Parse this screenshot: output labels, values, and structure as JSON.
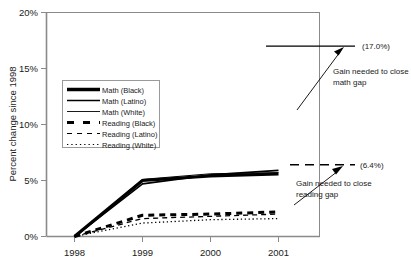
{
  "chart_data": {
    "type": "line",
    "title": "",
    "xlabel": "",
    "ylabel": "Percent change since 1998",
    "x": [
      "1998",
      "1999",
      "2000",
      "2001"
    ],
    "xtick_labels": [
      "1998",
      "1999",
      "2000",
      "2001"
    ],
    "ytick_labels": [
      "0%",
      "5%",
      "10%",
      "15%",
      "20%"
    ],
    "ytick_values": [
      0,
      5,
      10,
      15,
      20
    ],
    "ylim": [
      0,
      20
    ],
    "grid": false,
    "legend_position": "upper-left-inside",
    "series": [
      {
        "name": "Math (Black)",
        "style": "solid-thick",
        "values": [
          0.0,
          5.0,
          5.4,
          5.6
        ]
      },
      {
        "name": "Math (Latino)",
        "style": "solid-medium",
        "values": [
          0.0,
          4.7,
          5.5,
          5.9
        ]
      },
      {
        "name": "Math (White)",
        "style": "solid-thin",
        "values": [
          0.0,
          5.1,
          5.6,
          5.7
        ]
      },
      {
        "name": "Reading (Black)",
        "style": "dashed-thick",
        "values": [
          0.0,
          1.9,
          2.0,
          2.2
        ]
      },
      {
        "name": "Reading (Latino)",
        "style": "dashed-thin",
        "values": [
          0.0,
          1.6,
          1.8,
          2.0
        ]
      },
      {
        "name": "Reading (White)",
        "style": "dotted",
        "values": [
          0.0,
          1.2,
          1.5,
          1.6
        ]
      }
    ],
    "annotations": [
      {
        "id": "math-gap",
        "value": 17.0,
        "value_label": "(17.0%)",
        "text": "Gain needed to close math gap"
      },
      {
        "id": "reading-gap",
        "value": 6.4,
        "value_label": "(6.4%)",
        "text": "Gain needed to close reading gap"
      }
    ]
  },
  "axis": {
    "y_label": "Percent change since 1998",
    "y_ticks": [
      "20%",
      "15%",
      "10%",
      "5%",
      "0%"
    ],
    "x_ticks": [
      "1998",
      "1999",
      "2000",
      "2001"
    ]
  },
  "legend": {
    "items": [
      {
        "label": "Math (Black)"
      },
      {
        "label": "Math (Latino)"
      },
      {
        "label": "Math (White)"
      },
      {
        "label": "Reading (Black)"
      },
      {
        "label": "Reading (Latino)"
      },
      {
        "label": "Reading (White)"
      }
    ]
  },
  "annotations": {
    "math_value": "(17.0%)",
    "math_text_line1": "Gain needed to close",
    "math_text_line2": "math gap",
    "reading_value": "(6.4%)",
    "reading_text_line1": "Gain needed to close",
    "reading_text_line2": "reading gap"
  },
  "colors": {
    "line": "#000000",
    "axis": "#808080",
    "text": "#1a1a1a"
  }
}
